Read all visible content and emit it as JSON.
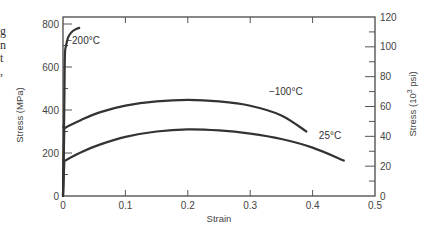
{
  "caption_fragments": [
    "g",
    "n",
    "t",
    ","
  ],
  "chart_data": {
    "type": "line",
    "title": "",
    "xlabel": "Strain",
    "ylabel": "Stress (MPa)",
    "y2label_main": "Stress (10",
    "y2label_sup": "3",
    "y2label_tail": " psi)",
    "xlim": [
      0,
      0.5
    ],
    "ylim": [
      0,
      833
    ],
    "y2lim": [
      0,
      120
    ],
    "grid": false,
    "x_ticks": [
      0,
      0.1,
      0.2,
      0.3,
      0.4,
      0.5
    ],
    "x_tick_labels": [
      "0",
      "0.1",
      "0.2",
      "0.3",
      "0.4",
      "0.5"
    ],
    "y_ticks": [
      0,
      200,
      400,
      600,
      800
    ],
    "y_tick_labels": [
      "0",
      "200",
      "400",
      "600",
      "800"
    ],
    "y_minor_ticks": [
      100,
      300,
      500,
      700
    ],
    "y2_ticks": [
      0,
      20,
      40,
      60,
      80,
      100,
      120
    ],
    "y2_tick_labels": [
      "0",
      "20",
      "40",
      "60",
      "80",
      "100",
      "120"
    ],
    "y2_minor_ticks": [
      10,
      30,
      50,
      70,
      90,
      110
    ],
    "series": [
      {
        "name": "-200°C",
        "label": "−200°C",
        "points": [
          [
            0,
            0
          ],
          [
            0.002,
            400
          ],
          [
            0.003,
            650
          ],
          [
            0.005,
            700
          ],
          [
            0.008,
            735
          ],
          [
            0.013,
            760
          ],
          [
            0.02,
            775
          ],
          [
            0.026,
            782
          ]
        ]
      },
      {
        "name": "-100°C",
        "label": "−100°C",
        "points": [
          [
            0,
            0
          ],
          [
            0.002,
            300
          ],
          [
            0.003,
            316
          ],
          [
            0.03,
            355
          ],
          [
            0.06,
            390
          ],
          [
            0.1,
            420
          ],
          [
            0.15,
            440
          ],
          [
            0.2,
            447
          ],
          [
            0.25,
            440
          ],
          [
            0.3,
            420
          ],
          [
            0.35,
            375
          ],
          [
            0.39,
            300
          ]
        ]
      },
      {
        "name": "25°C",
        "label": "25°C",
        "points": [
          [
            0,
            0
          ],
          [
            0.002,
            150
          ],
          [
            0.003,
            163
          ],
          [
            0.03,
            205
          ],
          [
            0.06,
            240
          ],
          [
            0.1,
            275
          ],
          [
            0.15,
            300
          ],
          [
            0.2,
            310
          ],
          [
            0.25,
            305
          ],
          [
            0.3,
            290
          ],
          [
            0.35,
            265
          ],
          [
            0.4,
            225
          ],
          [
            0.45,
            165
          ]
        ]
      }
    ]
  }
}
